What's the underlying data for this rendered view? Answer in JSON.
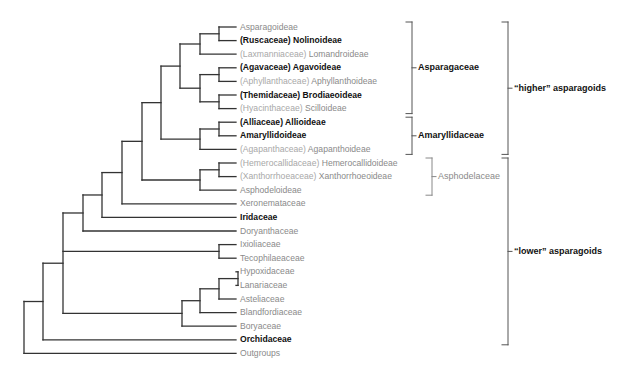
{
  "figure": {
    "type": "cladogram",
    "line_color": "#333333",
    "leaves": [
      {
        "prefix": "",
        "name": "Asparagoideae",
        "bold": false
      },
      {
        "prefix": "(Ruscaceae) ",
        "name": "Nolinoideae",
        "bold": true
      },
      {
        "prefix": "(Laxmanniaceae) ",
        "name": "Lomandroideae",
        "bold": false
      },
      {
        "prefix": "(Agavaceae) ",
        "name": "Agavoideae",
        "bold": true
      },
      {
        "prefix": "(Aphyllanthaceae) ",
        "name": "Aphyllanthoideae",
        "bold": false
      },
      {
        "prefix": "(Themidaceae) ",
        "name": "Brodiaeoideae",
        "bold": true
      },
      {
        "prefix": "(Hyacinthaceae) ",
        "name": "Scilloideae",
        "bold": false
      },
      {
        "prefix": "(Alliaceae) ",
        "name": "Allioideae",
        "bold": true
      },
      {
        "prefix": "",
        "name": "Amaryllidoideae",
        "bold": true
      },
      {
        "prefix": "(Agapanthaceae) ",
        "name": "Agapanthoideae",
        "bold": false
      },
      {
        "prefix": "(Hemerocallidaceae) ",
        "name": "Hemerocallidoideae",
        "bold": false
      },
      {
        "prefix": "(Xanthorrhoeaceae) ",
        "name": "Xanthorrhoeoideae",
        "bold": false
      },
      {
        "prefix": "",
        "name": "Asphodeloideae",
        "bold": false
      },
      {
        "prefix": "",
        "name": "Xeronemataceae",
        "bold": false
      },
      {
        "prefix": "",
        "name": "Iridaceae",
        "bold": true
      },
      {
        "prefix": "",
        "name": "Doryanthaceae",
        "bold": false
      },
      {
        "prefix": "",
        "name": "Ixioliaceae",
        "bold": false
      },
      {
        "prefix": "",
        "name": "Tecophilaeaceae",
        "bold": false
      },
      {
        "prefix": "",
        "name": "Hypoxidaceae",
        "bold": false
      },
      {
        "prefix": "",
        "name": "Lanariaceae",
        "bold": false
      },
      {
        "prefix": "",
        "name": "Asteliaceae",
        "bold": false
      },
      {
        "prefix": "",
        "name": "Blandfordiaceae",
        "bold": false
      },
      {
        "prefix": "",
        "name": "Boryaceae",
        "bold": false
      },
      {
        "prefix": "",
        "name": "Orchidaceae",
        "bold": true
      },
      {
        "prefix": "",
        "name": "Outgroups",
        "bold": false
      }
    ],
    "groups": [
      {
        "label": "Asparagaceae",
        "from_leaf": 0,
        "to_leaf": 6,
        "bold": true
      },
      {
        "label": "Amaryllidaceae",
        "from_leaf": 7,
        "to_leaf": 9,
        "bold": true
      },
      {
        "label": "Asphodelaceae",
        "from_leaf": 10,
        "to_leaf": 12,
        "bold": false
      },
      {
        "label": "“higher” asparagoids",
        "from_leaf": 0,
        "to_leaf": 9,
        "bold": true
      },
      {
        "label": "“lower” asparagoids",
        "from_leaf": 10,
        "to_leaf": 23,
        "bold": true
      }
    ]
  }
}
